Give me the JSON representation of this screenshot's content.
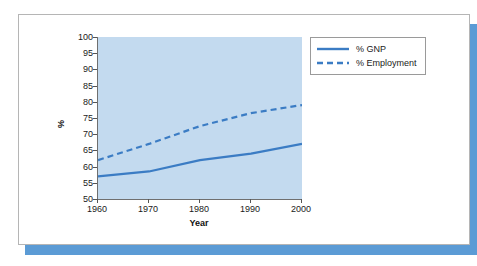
{
  "chart_data": {
    "type": "line",
    "title": "",
    "xlabel": "Year",
    "ylabel": "%",
    "x": [
      1960,
      1970,
      1980,
      1990,
      2000
    ],
    "xlim": [
      1960,
      2000
    ],
    "ylim": [
      50,
      100
    ],
    "ytick_labels": [
      "100",
      "95",
      "90",
      "85",
      "80",
      "75",
      "70",
      "65",
      "60",
      "55",
      "50"
    ],
    "ytick_values": [
      100,
      95,
      90,
      85,
      80,
      75,
      70,
      65,
      60,
      55,
      50
    ],
    "xtick_labels": [
      "1960",
      "1970",
      "1980",
      "1990",
      "2000"
    ],
    "grid": false,
    "legend_position": "top-right",
    "plot_background": "#c3daef",
    "series": [
      {
        "name": "% GNP",
        "style": "solid",
        "color": "#3b7cc4",
        "values": [
          57,
          58.5,
          62,
          64,
          67
        ]
      },
      {
        "name": "% Employment",
        "style": "dashed",
        "color": "#3b7cc4",
        "values": [
          62,
          67,
          72.5,
          76.5,
          79
        ]
      }
    ]
  },
  "legend": {
    "items": [
      {
        "label": "% GNP"
      },
      {
        "label": "% Employment"
      }
    ]
  },
  "axes": {
    "y_title": "%",
    "x_title": "Year"
  }
}
